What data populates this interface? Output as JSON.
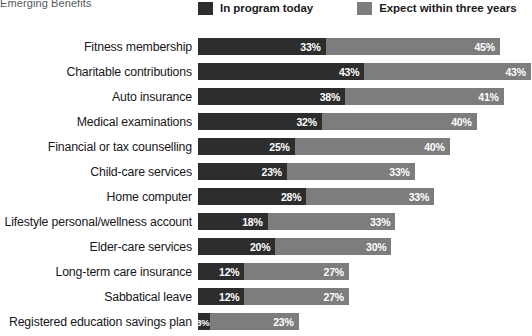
{
  "title": "Emerging Benefits",
  "legend": {
    "position": "top",
    "items": [
      {
        "label": "In program today",
        "color": "#2d2d2d",
        "swatch": "legend-swatch-dark"
      },
      {
        "label": "Expect within three years",
        "color": "#7d7d7d",
        "swatch": "legend-swatch-light"
      }
    ]
  },
  "chart_data": {
    "type": "bar",
    "orientation": "horizontal",
    "stacked": true,
    "title": "Emerging Benefits",
    "xlabel": "",
    "ylabel": "",
    "xlim": [
      0,
      86
    ],
    "grid": false,
    "value_suffix": "%",
    "legend_position": "top",
    "categories": [
      "Fitness membership",
      "Charitable contributions",
      "Auto insurance",
      "Medical examinations",
      "Financial or tax counselling",
      "Child-care services",
      "Home computer",
      "Lifestyle personal/wellness account",
      "Elder-care services",
      "Long-term care insurance",
      "Sabbatical leave",
      "Registered education savings plan"
    ],
    "series": [
      {
        "name": "In program today",
        "color": "#2d2d2d",
        "values": [
          33,
          43,
          38,
          32,
          25,
          23,
          28,
          18,
          20,
          12,
          12,
          3
        ],
        "labels": [
          "33%",
          "43%",
          "38%",
          "32%",
          "25%",
          "23%",
          "28%",
          "18%",
          "20%",
          "12%",
          "12%",
          "3%"
        ]
      },
      {
        "name": "Expect within three years",
        "color": "#7d7d7d",
        "values": [
          45,
          43,
          41,
          40,
          40,
          33,
          33,
          33,
          30,
          27,
          27,
          23
        ],
        "labels": [
          "45%",
          "43%",
          "41%",
          "40%",
          "40%",
          "33%",
          "33%",
          "33%",
          "30%",
          "27%",
          "27%",
          "23%"
        ]
      }
    ],
    "rows": [
      {
        "label": "Fitness membership",
        "in_program": 33,
        "in_program_label": "33%",
        "expect": 45,
        "expect_label": "45%"
      },
      {
        "label": "Charitable contributions",
        "in_program": 43,
        "in_program_label": "43%",
        "expect": 43,
        "expect_label": "43%"
      },
      {
        "label": "Auto insurance",
        "in_program": 38,
        "in_program_label": "38%",
        "expect": 41,
        "expect_label": "41%"
      },
      {
        "label": "Medical examinations",
        "in_program": 32,
        "in_program_label": "32%",
        "expect": 40,
        "expect_label": "40%"
      },
      {
        "label": "Financial or tax counselling",
        "in_program": 25,
        "in_program_label": "25%",
        "expect": 40,
        "expect_label": "40%"
      },
      {
        "label": "Child-care services",
        "in_program": 23,
        "in_program_label": "23%",
        "expect": 33,
        "expect_label": "33%"
      },
      {
        "label": "Home computer",
        "in_program": 28,
        "in_program_label": "28%",
        "expect": 33,
        "expect_label": "33%"
      },
      {
        "label": "Lifestyle personal/wellness account",
        "in_program": 18,
        "in_program_label": "18%",
        "expect": 33,
        "expect_label": "33%"
      },
      {
        "label": "Elder-care services",
        "in_program": 20,
        "in_program_label": "20%",
        "expect": 30,
        "expect_label": "30%"
      },
      {
        "label": "Long-term care insurance",
        "in_program": 12,
        "in_program_label": "12%",
        "expect": 27,
        "expect_label": "27%"
      },
      {
        "label": "Sabbatical leave",
        "in_program": 12,
        "in_program_label": "12%",
        "expect": 27,
        "expect_label": "27%"
      },
      {
        "label": "Registered education savings plan",
        "in_program": 3,
        "in_program_label": "3%",
        "expect": 23,
        "expect_label": "23%"
      }
    ]
  },
  "layout": {
    "bar_origin_x": 198,
    "px_per_percent": 3.87,
    "row_pitch": 25,
    "first_row_top": 38,
    "bar_height": 17
  }
}
